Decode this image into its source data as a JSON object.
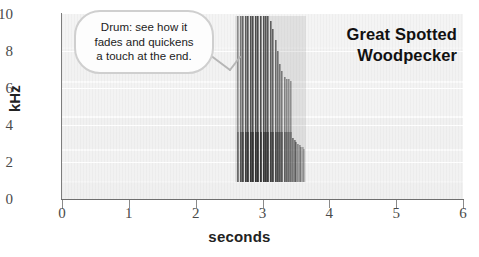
{
  "chart_data": {
    "type": "heatmap",
    "title": "Great Spotted Woodpecker",
    "subtitle": "",
    "xlabel": "seconds",
    "ylabel": "kHz",
    "xlim": [
      0,
      6
    ],
    "ylim": [
      0,
      10
    ],
    "x_ticks": [
      "0",
      "1",
      "2",
      "3",
      "4",
      "5",
      "6"
    ],
    "x_tick_values": [
      0,
      1,
      2,
      3,
      4,
      5,
      6
    ],
    "y_ticks": [
      "0",
      "2",
      "4",
      "6",
      "8",
      "10"
    ],
    "y_tick_values": [
      0,
      2,
      4,
      6,
      8,
      10
    ],
    "grid": "horizontal-faint",
    "legend": "none",
    "events": [
      {
        "name": "drum-roll",
        "t_start": 2.62,
        "t_end": 3.62,
        "freq_low": 0.9,
        "freq_high": 9.9,
        "strike_count": 26,
        "notes": "rapid series of vertical broadband strikes; fades and quickens toward the end"
      }
    ],
    "strikes": [
      {
        "t": 2.625,
        "f_top": 9.9,
        "f_bottom": 0.9,
        "intensity": 0.55
      },
      {
        "t": 2.66,
        "f_top": 9.9,
        "f_bottom": 0.9,
        "intensity": 0.7
      },
      {
        "t": 2.695,
        "f_top": 9.9,
        "f_bottom": 0.9,
        "intensity": 0.8
      },
      {
        "t": 2.733,
        "f_top": 9.9,
        "f_bottom": 0.9,
        "intensity": 0.88
      },
      {
        "t": 2.772,
        "f_top": 9.9,
        "f_bottom": 0.9,
        "intensity": 0.92
      },
      {
        "t": 2.81,
        "f_top": 9.9,
        "f_bottom": 0.9,
        "intensity": 0.95
      },
      {
        "t": 2.848,
        "f_top": 9.9,
        "f_bottom": 0.9,
        "intensity": 0.97
      },
      {
        "t": 2.886,
        "f_top": 9.9,
        "f_bottom": 0.9,
        "intensity": 1.0
      },
      {
        "t": 2.924,
        "f_top": 9.9,
        "f_bottom": 0.9,
        "intensity": 0.98
      },
      {
        "t": 2.962,
        "f_top": 9.9,
        "f_bottom": 0.9,
        "intensity": 0.96
      },
      {
        "t": 3.0,
        "f_top": 9.9,
        "f_bottom": 0.9,
        "intensity": 0.94
      },
      {
        "t": 3.037,
        "f_top": 9.9,
        "f_bottom": 0.9,
        "intensity": 0.92
      },
      {
        "t": 3.074,
        "f_top": 9.9,
        "f_bottom": 0.9,
        "intensity": 0.9
      },
      {
        "t": 3.11,
        "f_top": 9.6,
        "f_bottom": 0.9,
        "intensity": 0.86
      },
      {
        "t": 3.146,
        "f_top": 9.2,
        "f_bottom": 0.9,
        "intensity": 0.82
      },
      {
        "t": 3.181,
        "f_top": 8.6,
        "f_bottom": 0.9,
        "intensity": 0.78
      },
      {
        "t": 3.216,
        "f_top": 8.0,
        "f_bottom": 0.9,
        "intensity": 0.74
      },
      {
        "t": 3.25,
        "f_top": 7.3,
        "f_bottom": 0.9,
        "intensity": 0.7
      },
      {
        "t": 3.283,
        "f_top": 6.9,
        "f_bottom": 0.9,
        "intensity": 0.66
      },
      {
        "t": 3.316,
        "f_top": 6.6,
        "f_bottom": 0.9,
        "intensity": 0.62
      },
      {
        "t": 3.348,
        "f_top": 6.5,
        "f_bottom": 0.9,
        "intensity": 0.58
      },
      {
        "t": 3.379,
        "f_top": 6.5,
        "f_bottom": 0.9,
        "intensity": 0.55
      },
      {
        "t": 3.409,
        "f_top": 6.4,
        "f_bottom": 0.9,
        "intensity": 0.52
      },
      {
        "t": 3.438,
        "f_top": 3.3,
        "f_bottom": 0.9,
        "intensity": 0.48
      },
      {
        "t": 3.466,
        "f_top": 3.2,
        "f_bottom": 0.9,
        "intensity": 0.44
      },
      {
        "t": 3.493,
        "f_top": 3.1,
        "f_bottom": 0.9,
        "intensity": 0.4
      },
      {
        "t": 3.519,
        "f_top": 3.0,
        "f_bottom": 0.9,
        "intensity": 0.36
      },
      {
        "t": 3.544,
        "f_top": 2.9,
        "f_bottom": 0.9,
        "intensity": 0.32
      },
      {
        "t": 3.568,
        "f_top": 2.8,
        "f_bottom": 0.9,
        "intensity": 0.28
      },
      {
        "t": 3.591,
        "f_top": 2.8,
        "f_bottom": 0.9,
        "intensity": 0.24
      },
      {
        "t": 3.613,
        "f_top": 2.7,
        "f_bottom": 0.9,
        "intensity": 0.2
      }
    ]
  },
  "callout": {
    "line1": "Drum: see how it",
    "line2": "fades and quickens",
    "line3": "a touch at the end."
  },
  "title": {
    "line1": "Great Spotted",
    "line2": "Woodpecker"
  },
  "axes": {
    "x_title": "seconds",
    "y_title": "kHz"
  },
  "colors": {
    "ink": "#1c1c1c",
    "axis": "#7d7d7d",
    "plot_background": "#f4f4f4",
    "spectrogram_ink": "#444444",
    "callout_border": "#cfcfcf"
  }
}
